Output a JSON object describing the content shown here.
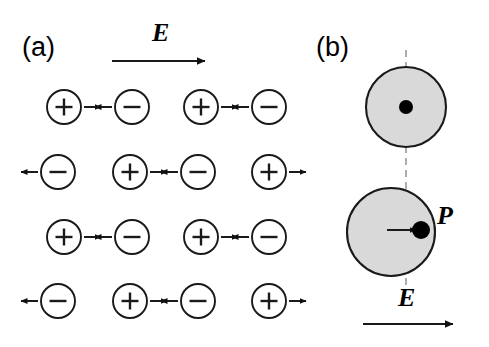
{
  "figure": {
    "background": "#ffffff",
    "stroke": "#1a1a1a",
    "atom_fill": "#d9d9d9",
    "dash_color": "#999999"
  },
  "panels": [
    {
      "id": "a",
      "label": "(a)",
      "field_arrow": {
        "label": "E",
        "direction": "right",
        "x1": 112,
        "x2": 213,
        "y": 61
      },
      "description": "lattice of displaced positive and negative ions in an applied field",
      "rows": [
        {
          "y": 107,
          "charges": [
            {
              "sign": "+",
              "cx": 64,
              "arrow": "right"
            },
            {
              "sign": "−",
              "cx": 132,
              "arrow": "left"
            },
            {
              "sign": "+",
              "cx": 201,
              "arrow": "right"
            },
            {
              "sign": "−",
              "cx": 269,
              "arrow": "left"
            }
          ]
        },
        {
          "y": 172,
          "charges": [
            {
              "sign": "−",
              "cx": 58,
              "arrow": "left"
            },
            {
              "sign": "+",
              "cx": 130,
              "arrow": "right"
            },
            {
              "sign": "−",
              "cx": 198,
              "arrow": "left"
            },
            {
              "sign": "+",
              "cx": 269,
              "arrow": "right"
            }
          ]
        },
        {
          "y": 237,
          "charges": [
            {
              "sign": "+",
              "cx": 64,
              "arrow": "right"
            },
            {
              "sign": "−",
              "cx": 132,
              "arrow": "left"
            },
            {
              "sign": "+",
              "cx": 201,
              "arrow": "right"
            },
            {
              "sign": "−",
              "cx": 269,
              "arrow": "left"
            }
          ]
        },
        {
          "y": 301,
          "charges": [
            {
              "sign": "−",
              "cx": 58,
              "arrow": "left"
            },
            {
              "sign": "+",
              "cx": 130,
              "arrow": "right"
            },
            {
              "sign": "−",
              "cx": 198,
              "arrow": "left"
            },
            {
              "sign": "+",
              "cx": 269,
              "arrow": "right"
            }
          ]
        }
      ],
      "charge_radius": 17
    },
    {
      "id": "b",
      "label": "(b)",
      "field_arrow": {
        "label": "E",
        "direction": "right",
        "x1": 363,
        "x2": 461,
        "y": 324
      },
      "description": "single atom before and after polarization; nucleus displaced from centre",
      "dashed_axis": {
        "x": 406,
        "y1": 50,
        "y2": 287
      },
      "atoms": [
        {
          "name": "unpolarized-atom",
          "cx": 406,
          "cy": 107,
          "r": 40,
          "nucleus": {
            "cx": 406,
            "cy": 107,
            "r": 7
          },
          "displacement_arrow": null
        },
        {
          "name": "polarized-atom",
          "cx": 391,
          "cy": 232,
          "r": 44,
          "nucleus": {
            "cx": 421,
            "cy": 230,
            "r": 9
          },
          "displacement_arrow": {
            "x1": 387,
            "x2": 416,
            "y": 230,
            "label": "P"
          }
        }
      ],
      "dipole_label": "P"
    }
  ]
}
